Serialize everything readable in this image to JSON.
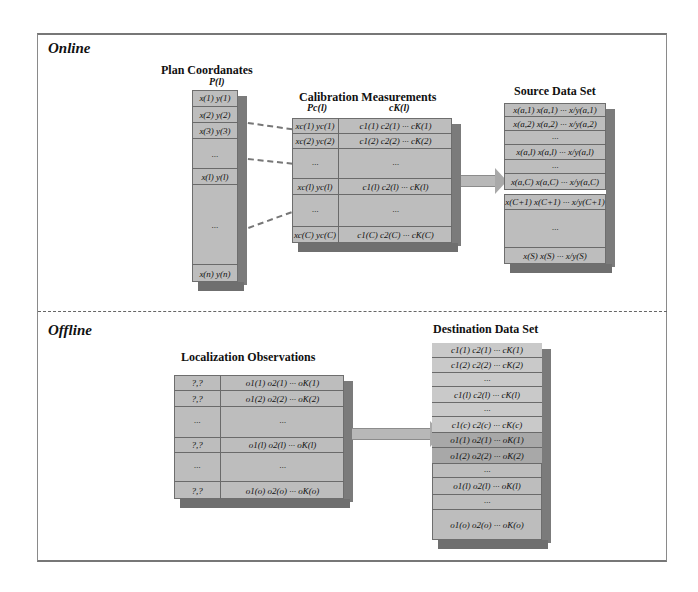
{
  "online": {
    "section_title": "Online",
    "plan_coordinates": {
      "title": "Plan Coordanates",
      "label": "P(l)",
      "rows": [
        "x(1) y(1)",
        "x(2) y(2)",
        "x(3) y(3)",
        "...",
        "x(l) y(l)",
        "...",
        "x(n) y(n)"
      ]
    },
    "calibration_measurements": {
      "title": "Calibration Measurements",
      "label_left": "Pc(l)",
      "label_right": "cK(l)",
      "rows": [
        {
          "left": "xc(1) yc(1)",
          "right": "c1(1) c2(1) ··· cK(1)"
        },
        {
          "left": "xc(2) yc(2)",
          "right": "c1(2) c2(2) ··· cK(2)"
        },
        {
          "left": "···",
          "right": "···"
        },
        {
          "left": "xc(l) yc(l)",
          "right": "c1(l) c2(l) ··· cK(l)"
        },
        {
          "left": "···",
          "right": "···"
        },
        {
          "left": "xc(C) yc(C)",
          "right": "c1(C) c2(C) ··· cK(C)"
        }
      ]
    },
    "source_data_set": {
      "title": "Source Data Set",
      "rows": [
        "x(a,1) x(a,1) ··· x/y(a,1)",
        "x(a,2) x(a,2) ··· x/y(a,2)",
        "···",
        "x(a,l) x(a,l) ··· x/y(a,l)",
        "···",
        "x(a,C) x(a,C) ··· x/y(a,C)",
        "",
        "x(C+1) x(C+1) ··· x/y(C+1)",
        "···",
        "x(S) x(S) ··· x/y(S)"
      ]
    }
  },
  "offline": {
    "section_title": "Offline",
    "localization_observations": {
      "title": "Localization Observations",
      "rows": [
        {
          "left": "?,?",
          "right": "o1(1) o2(1) ··· oK(1)"
        },
        {
          "left": "?,?",
          "right": "o1(2) o2(2) ··· oK(2)"
        },
        {
          "left": "···",
          "right": "···"
        },
        {
          "left": "?,?",
          "right": "o1(l) o2(l) ··· oK(l)"
        },
        {
          "left": "···",
          "right": "···"
        },
        {
          "left": "?,?",
          "right": "o1(o) o2(o) ··· oK(o)"
        }
      ]
    },
    "destination_data_set": {
      "title": "Destination Data Set",
      "rows": [
        "c1(1) c2(1) ··· cK(1)",
        "c1(2) c2(2) ··· cK(2)",
        "···",
        "c1(l) c2(l) ··· cK(l)",
        "···",
        "c1(c) c2(c) ··· cK(c)",
        "o1(1) o2(1) ··· oK(1)",
        "o1(2) o2(2) ··· oK(2)",
        "···",
        "o1(l) o2(l) ··· oK(l)",
        "···",
        "o1(o) o2(o) ··· oK(o)"
      ]
    }
  }
}
